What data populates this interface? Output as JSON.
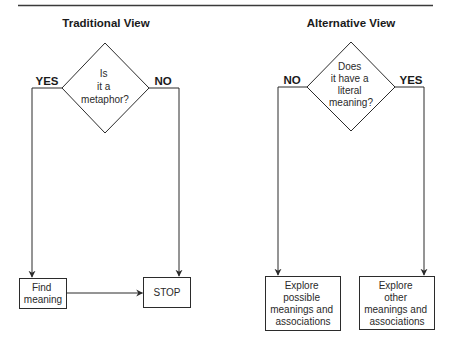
{
  "colors": {
    "line": "#2b2b2b",
    "text": "#1a1a1a",
    "background": "#ffffff"
  },
  "panels": [
    {
      "title": "Traditional View",
      "decision": {
        "lines": [
          "Is",
          "it a",
          "metaphor?"
        ]
      },
      "left_branch_label": "YES",
      "right_branch_label": "NO",
      "left_box": {
        "lines": [
          "Find",
          "meaning"
        ]
      },
      "right_box": {
        "lines": [
          "STOP"
        ]
      },
      "connector": "left-box-to-right-box"
    },
    {
      "title": "Alternative View",
      "decision": {
        "lines": [
          "Does",
          "it have a",
          "literal",
          "meaning?"
        ]
      },
      "left_branch_label": "NO",
      "right_branch_label": "YES",
      "left_box": {
        "lines": [
          "Explore",
          "possible",
          "meanings and",
          "associations"
        ]
      },
      "right_box": {
        "lines": [
          "Explore",
          "other",
          "meanings and",
          "associations"
        ]
      }
    }
  ]
}
